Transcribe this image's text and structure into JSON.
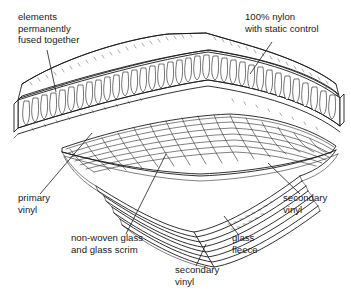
{
  "figure": {
    "background_color": "#ffffff",
    "line_color": "#1a1a1a",
    "labels": [
      {
        "id": "elements-fused",
        "lines": [
          "elements",
          "permanently",
          "fused together"
        ],
        "x": 18,
        "y": 20,
        "align": "start"
      },
      {
        "id": "nylon-static",
        "lines": [
          "100% nylon",
          "with static control"
        ],
        "x": 245,
        "y": 20,
        "align": "start"
      },
      {
        "id": "primary-vinyl",
        "lines": [
          "primary",
          "vinyl"
        ],
        "x": 18,
        "y": 201,
        "align": "start"
      },
      {
        "id": "secondary-vinyl-right",
        "lines": [
          "secondary",
          "vinyl"
        ],
        "x": 283,
        "y": 201,
        "align": "start"
      },
      {
        "id": "non-woven-glass",
        "lines": [
          "non-woven glass",
          "and glass scrim"
        ],
        "x": 71,
        "y": 241,
        "align": "start"
      },
      {
        "id": "glass-fleece",
        "lines": [
          "glass",
          "fleece"
        ],
        "x": 232,
        "y": 241,
        "align": "start"
      },
      {
        "id": "secondary-vinyl-bottom",
        "lines": [
          "secondary",
          "vinyl"
        ],
        "x": 175,
        "y": 273,
        "align": "start"
      }
    ],
    "layers": [
      "100% nylon pile with static control",
      "primary vinyl",
      "non-woven glass and glass scrim",
      "glass fleece",
      "secondary vinyl"
    ]
  }
}
